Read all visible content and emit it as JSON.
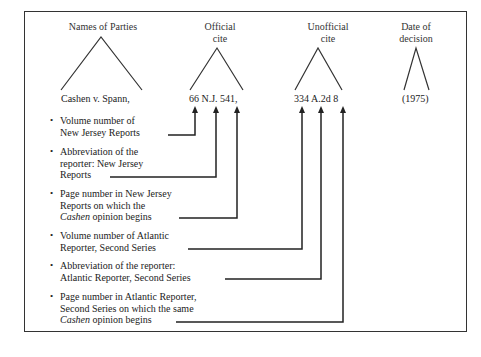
{
  "headings": {
    "parties": "Names of Parties",
    "official_1": "Official",
    "official_2": "cite",
    "unofficial_1": "Unofficial",
    "unofficial_2": "cite",
    "date_1": "Date of",
    "date_2": "decision"
  },
  "citation": {
    "parties": "Cashen v. Spann,",
    "official": "66 N.J. 541,",
    "unofficial": "334 A.2d 8",
    "date": "(1975)"
  },
  "bullet": "•",
  "items": [
    {
      "line1": "Volume number of",
      "line2": "New Jersey Reports"
    },
    {
      "line1": "Abbreviation of the",
      "line2": "reporter: New Jersey",
      "line3": "Reports"
    },
    {
      "line1": "Page number in New Jersey",
      "line2": "Reports on which the",
      "line3_italic": "Cashen",
      "line3_rest": " opinion begins"
    },
    {
      "line1": "Volume number of Atlantic",
      "line2": "Reporter, Second Series"
    },
    {
      "line1": "Abbreviation of the reporter:",
      "line2": "Atlantic Reporter, Second Series"
    },
    {
      "line1": "Page number in Atlantic Reporter,",
      "line2": "Second Series on which the same",
      "line3_italic": "Cashen",
      "line3_rest": " opinion begins"
    }
  ]
}
